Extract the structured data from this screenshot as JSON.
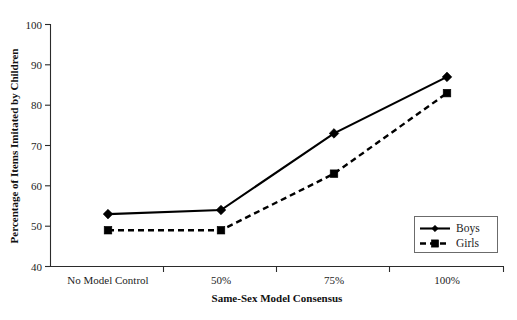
{
  "chart_data": {
    "type": "line",
    "title": "",
    "subtitle": "",
    "xlabel": "Same-Sex Model Consensus",
    "ylabel": "Percentage of Items Imitated by Children",
    "categories": [
      "No Model Control",
      "50%",
      "75%",
      "100%"
    ],
    "ylim": [
      40,
      100
    ],
    "yticks": [
      40,
      50,
      60,
      70,
      80,
      90,
      100
    ],
    "ytick_labels": [
      "40",
      "50",
      "60",
      "70",
      "80",
      "90",
      "100"
    ],
    "grid": false,
    "legend_position": "lower-right",
    "series": [
      {
        "name": "Boys",
        "values": [
          53,
          54,
          73,
          87
        ],
        "line_style": "solid",
        "marker": "diamond",
        "color": "#000000"
      },
      {
        "name": "Girls",
        "values": [
          49,
          49,
          63,
          83
        ],
        "line_style": "dashed",
        "marker": "square",
        "color": "#000000"
      }
    ]
  },
  "legend": {
    "entries": [
      {
        "label": "Boys"
      },
      {
        "label": "Girls"
      }
    ]
  },
  "axes": {
    "y_title": "Percentage of Items Imitated by Children",
    "x_title": "Same-Sex Model Consensus",
    "y_tick_0": "40",
    "y_tick_1": "50",
    "y_tick_2": "60",
    "y_tick_3": "70",
    "y_tick_4": "80",
    "y_tick_5": "90",
    "y_tick_6": "100",
    "x_cat_0": "No Model Control",
    "x_cat_1": "50%",
    "x_cat_2": "75%",
    "x_cat_3": "100%"
  },
  "colors": {
    "background": "#ffffff",
    "ink": "#000000",
    "axis": "#2b2b2b",
    "legend_border": "#6b6b6b"
  }
}
